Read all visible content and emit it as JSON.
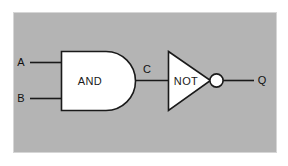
{
  "diagram": {
    "canvas": {
      "width": 288,
      "height": 166,
      "background": "#ffffff"
    },
    "panel": {
      "fill": "#b4b4b4",
      "border_color": "#d8d8d8",
      "x": 13,
      "y": 12,
      "width": 264,
      "height": 141
    },
    "wire_color": "#1a1a1a",
    "gate_fill": "#ffffff",
    "gate_stroke": "#1a1a1a",
    "labels": {
      "input_a": "A",
      "input_b": "B",
      "intermediate_c": "C",
      "output_q": "Q",
      "and_gate": "AND",
      "not_gate": "NOT"
    },
    "nodes": [
      {
        "id": "input-a",
        "label": "A",
        "kind": "input-terminal",
        "x": 21,
        "y": 62
      },
      {
        "id": "input-b",
        "label": "B",
        "kind": "input-terminal",
        "x": 21,
        "y": 98
      },
      {
        "id": "and-gate",
        "label": "AND",
        "kind": "and-gate",
        "x": 61,
        "y": 51,
        "width": 75,
        "height": 59
      },
      {
        "id": "wire-c",
        "label": "C",
        "kind": "net-label",
        "x": 146,
        "y": 69
      },
      {
        "id": "not-gate",
        "label": "NOT",
        "kind": "not-gate",
        "x": 168,
        "y": 51,
        "width": 56,
        "height": 59
      },
      {
        "id": "output-q",
        "label": "Q",
        "kind": "output-terminal",
        "x": 261,
        "y": 80
      }
    ],
    "connections": [
      {
        "id": "wire-a-to-and",
        "from": "input-a",
        "to": "and-gate",
        "label": "A"
      },
      {
        "id": "wire-b-to-and",
        "from": "input-b",
        "to": "and-gate",
        "label": "B"
      },
      {
        "id": "wire-and-to-not",
        "from": "and-gate",
        "to": "not-gate",
        "label": "C"
      },
      {
        "id": "wire-not-to-output",
        "from": "not-gate",
        "to": "output-q",
        "label": "Q"
      }
    ]
  }
}
